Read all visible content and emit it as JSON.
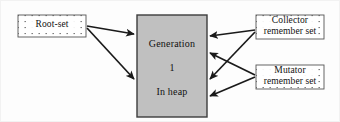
{
  "diagram": {
    "canvas": {
      "width": 340,
      "height": 122
    },
    "colors": {
      "generation_fill": "#c0c0c0",
      "generation_stroke": "#3c3c3c",
      "dotted_box_fill": "#ffffff",
      "dotted_box_stroke": "#555555",
      "arrow_color": "#1a1a1a",
      "page_background": "#fdfdfd",
      "outer_border": "#f2f2f2"
    },
    "nodes": {
      "root_set": {
        "label": "Root-set",
        "style": "dotted-fill-box",
        "x": 17,
        "y": 14,
        "width": 68,
        "height": 22
      },
      "generation": {
        "line1": "Generation",
        "line2": "1",
        "line3": "In heap",
        "style": "gray-filled-box",
        "x": 136,
        "y": 14,
        "width": 70,
        "height": 102
      },
      "collector_remember_set": {
        "line1": "Collector",
        "line2": "remember set",
        "style": "dotted-fill-box",
        "x": 255,
        "y": 14,
        "width": 68,
        "height": 24
      },
      "mutator_remember_set": {
        "line1": "Mutator",
        "line2": "remember set",
        "style": "dotted-fill-box",
        "x": 255,
        "y": 64,
        "width": 68,
        "height": 24
      }
    },
    "edges": [
      {
        "name": "root-set-to-generation-upper",
        "from": "root_set",
        "to": "generation",
        "direction": "right"
      },
      {
        "name": "root-set-to-generation-lower",
        "from": "root_set",
        "to": "generation",
        "direction": "right-down"
      },
      {
        "name": "collector-to-generation-upper",
        "from": "collector_remember_set",
        "to": "generation",
        "direction": "left"
      },
      {
        "name": "collector-to-generation-middle",
        "from": "collector_remember_set",
        "to": "generation",
        "direction": "left-down"
      },
      {
        "name": "mutator-to-generation-middle",
        "from": "mutator_remember_set",
        "to": "generation",
        "direction": "left-up"
      },
      {
        "name": "mutator-to-generation-lower",
        "from": "mutator_remember_set",
        "to": "generation",
        "direction": "left"
      }
    ]
  }
}
